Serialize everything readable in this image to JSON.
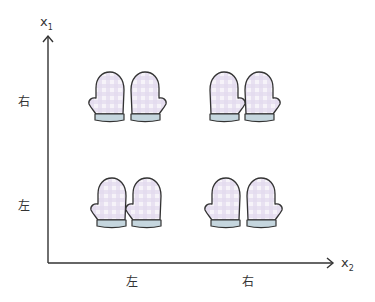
{
  "diagram": {
    "y_axis": {
      "label": "x",
      "subscript": "1",
      "categories": [
        {
          "label": "右",
          "row": "top"
        },
        {
          "label": "左",
          "row": "bottom"
        }
      ]
    },
    "x_axis": {
      "label": "x",
      "subscript": "2",
      "categories": [
        {
          "label": "左",
          "col": "left"
        },
        {
          "label": "右",
          "col": "right"
        }
      ]
    },
    "cells": [
      {
        "row": "top",
        "col": "left",
        "mittens": [
          {
            "thumb": "left"
          },
          {
            "thumb": "right"
          }
        ]
      },
      {
        "row": "top",
        "col": "right",
        "mittens": [
          {
            "thumb": "right"
          },
          {
            "thumb": "right"
          }
        ]
      },
      {
        "row": "bottom",
        "col": "left",
        "mittens": [
          {
            "thumb": "left"
          },
          {
            "thumb": "left"
          }
        ]
      },
      {
        "row": "bottom",
        "col": "right",
        "mittens": [
          {
            "thumb": "left"
          },
          {
            "thumb": "right"
          }
        ]
      }
    ],
    "colors": {
      "axis": "#333333",
      "mitten_outline": "#333333",
      "mitten_fill": "#f4f1f8",
      "check": "#ddd3ea",
      "cuff": "#c5d6de"
    }
  }
}
